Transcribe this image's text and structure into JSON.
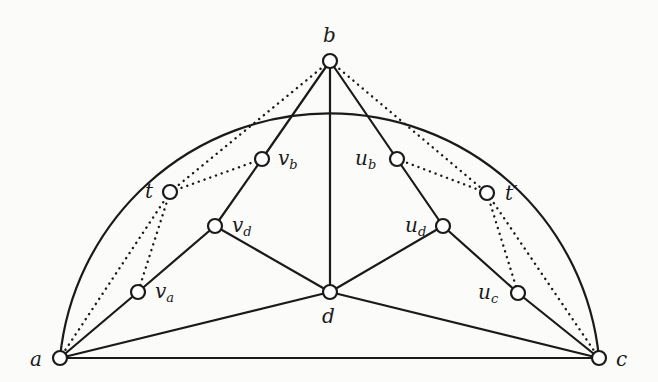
{
  "diagram": {
    "type": "graph",
    "nodes": [
      {
        "id": "a",
        "label": "a",
        "sub": "",
        "x": 60,
        "y": 358,
        "lx": 30,
        "ly": 366
      },
      {
        "id": "b",
        "label": "b",
        "sub": "",
        "x": 330,
        "y": 61,
        "lx": 323,
        "ly": 42
      },
      {
        "id": "c",
        "label": "c",
        "sub": "",
        "x": 599,
        "y": 358,
        "lx": 616,
        "ly": 366
      },
      {
        "id": "d",
        "label": "d",
        "sub": "",
        "x": 330,
        "y": 292,
        "lx": 322,
        "ly": 323
      },
      {
        "id": "t",
        "label": "t",
        "sub": "",
        "x": 170,
        "y": 192,
        "lx": 145,
        "ly": 198
      },
      {
        "id": "t_prime",
        "label": "t′",
        "sub": "",
        "x": 487,
        "y": 193,
        "lx": 505,
        "ly": 200
      },
      {
        "id": "v_b",
        "label": "v",
        "sub": "b",
        "x": 262,
        "y": 159,
        "lx": 278,
        "ly": 165
      },
      {
        "id": "u_b",
        "label": "u",
        "sub": "b",
        "x": 397,
        "y": 159,
        "lx": 355,
        "ly": 165
      },
      {
        "id": "v_d",
        "label": "v",
        "sub": "d",
        "x": 215,
        "y": 226,
        "lx": 232,
        "ly": 232
      },
      {
        "id": "u_d",
        "label": "u",
        "sub": "d",
        "x": 443,
        "y": 226,
        "lx": 405,
        "ly": 232
      },
      {
        "id": "v_a",
        "label": "v",
        "sub": "a",
        "x": 138,
        "y": 292,
        "lx": 155,
        "ly": 298
      },
      {
        "id": "u_c",
        "label": "u",
        "sub": "c",
        "x": 518,
        "y": 293,
        "lx": 478,
        "ly": 299
      }
    ],
    "solid_edges": [
      [
        "a",
        "c"
      ],
      [
        "a",
        "d"
      ],
      [
        "c",
        "d"
      ],
      [
        "b",
        "d"
      ],
      [
        "b",
        "v_b"
      ],
      [
        "v_b",
        "v_d"
      ],
      [
        "v_d",
        "v_a"
      ],
      [
        "v_a",
        "a"
      ],
      [
        "v_d",
        "d"
      ],
      [
        "b",
        "u_b"
      ],
      [
        "u_b",
        "u_d"
      ],
      [
        "u_d",
        "u_c"
      ],
      [
        "u_c",
        "c"
      ],
      [
        "u_d",
        "d"
      ]
    ],
    "dotted_edges": [
      [
        "b",
        "t"
      ],
      [
        "t",
        "v_b"
      ],
      [
        "t",
        "a"
      ],
      [
        "t",
        "v_a"
      ],
      [
        "b",
        "t_prime"
      ],
      [
        "t_prime",
        "u_b"
      ],
      [
        "t_prime",
        "c"
      ],
      [
        "t_prime",
        "u_c"
      ]
    ],
    "outer_arc": {
      "from": "a",
      "through": "b",
      "to": "c"
    }
  }
}
